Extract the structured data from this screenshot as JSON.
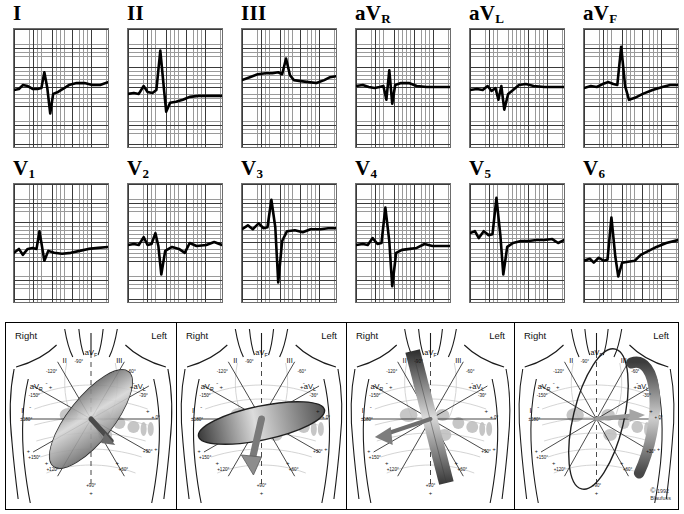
{
  "figure": {
    "copyright_mark": "©",
    "copyright_text": "1992\nBlaufuss"
  },
  "ecg": {
    "rows": [
      {
        "leads": [
          {
            "name": "I",
            "base": "I",
            "sub": ""
          },
          {
            "name": "II",
            "base": "II",
            "sub": ""
          },
          {
            "name": "III",
            "base": "III",
            "sub": ""
          },
          {
            "name": "aVR",
            "base": "aV",
            "sub": "R"
          },
          {
            "name": "aVL",
            "base": "aV",
            "sub": "L"
          },
          {
            "name": "aVF",
            "base": "aV",
            "sub": "F"
          }
        ]
      },
      {
        "leads": [
          {
            "name": "V1",
            "base": "V",
            "sub": "1"
          },
          {
            "name": "V2",
            "base": "V",
            "sub": "2"
          },
          {
            "name": "V3",
            "base": "V",
            "sub": "3"
          },
          {
            "name": "V4",
            "base": "V",
            "sub": "4"
          },
          {
            "name": "V5",
            "base": "V",
            "sub": "5"
          },
          {
            "name": "V6",
            "base": "V",
            "sub": "6"
          }
        ]
      }
    ]
  },
  "torso_panels": [
    {
      "id": "panel-1",
      "right_label": "Right",
      "left_label": "Left"
    },
    {
      "id": "panel-2",
      "right_label": "Right",
      "left_label": "Left"
    },
    {
      "id": "panel-3",
      "right_label": "Right",
      "left_label": "Left"
    },
    {
      "id": "panel-4",
      "right_label": "Right",
      "left_label": "Left"
    }
  ],
  "hexaxial": {
    "lead_labels": {
      "I": "I",
      "II": "II",
      "III": "III",
      "aVR_base": "aV",
      "aVR_sub": "R",
      "aVL_base": "aV",
      "aVL_sub": "L",
      "aVF_base": "aV",
      "aVF_sub": "F"
    },
    "angles": {
      "I_neg": "±180°",
      "I_pos": "+ 0°",
      "II_neg": "-120°",
      "II_pos": "+120°",
      "III_neg": "-60°",
      "III_pos": "+60°",
      "aVR_neg": "-150°",
      "aVR_pos": "+150°",
      "aVL_neg": "-30°",
      "aVL_pos": "+30°",
      "aVF_neg": "-90°",
      "aVF_pos": "+90°"
    },
    "polarity": {
      "plus": "+",
      "minus": "-"
    }
  },
  "chart_data": {
    "type": "line",
    "xlabel": "Time",
    "ylabel": "Amplitude (mV)",
    "grid": true,
    "legend_position": "none",
    "series": [
      {
        "name": "I",
        "points": "M0,62 L5,61 L9,57 L14,58 L19,61 L24,61 L28,60 L31,44 L34,60 L37,86 L40,66 L45,64 L50,61 L56,57 L64,55 L72,55 L80,57 L88,57 L96,54"
      },
      {
        "name": "II",
        "points": "M0,66 L6,65 L11,66 L16,58 L20,64 L25,65 L29,62 L33,22 L37,64 L39,84 L43,75 L49,74 L56,72 L63,69 L72,68 L82,68 L96,68"
      },
      {
        "name": "III",
        "points": "M0,52 L8,49 L16,46 L24,45 L31,45 L37,44 L41,46 L45,30 L49,47 L53,52 L60,53 L68,54 L76,55 L84,52 L90,49 L96,48"
      },
      {
        "name": "aVR",
        "points": "M0,58 L7,57 L13,59 L19,60 L24,59 L28,58 L31,72 L34,42 L37,76 L40,57 L46,55 L54,55 L62,58 L72,59 L84,59 L96,59"
      },
      {
        "name": "aVL",
        "points": "M0,62 L7,61 L13,62 L18,58 L22,63 L26,60 L29,72 L32,58 L35,82 L39,66 L44,62 L50,57 L57,56 L65,58 L76,59 L86,59 L96,59"
      },
      {
        "name": "aVF",
        "points": "M0,60 L7,58 L13,59 L19,56 L25,54 L30,56 L34,57 L38,18 L42,58 L46,72 L52,70 L60,66 L70,62 L80,59 L88,57 L96,57"
      },
      {
        "name": "V1",
        "points": "M0,70 L5,66 L9,72 L14,66 L19,65 L23,66 L26,48 L29,66 L31,78 L35,68 L41,70 L49,71 L58,70 L67,68 L76,66 L86,65 L96,64"
      },
      {
        "name": "V2",
        "points": "M0,62 L6,61 L11,62 L16,54 L20,62 L24,61 L28,50 L31,63 L34,92 L38,68 L45,64 L52,66 L58,70 L63,60 L70,63 L80,62 L88,59 L96,62"
      },
      {
        "name": "V3",
        "points": "M0,46 L6,42 L11,46 L17,40 L22,45 L26,44 L30,16 L34,44 L37,100 L41,58 L46,48 L54,47 L62,49 L70,46 L80,46 L88,45 L96,45"
      },
      {
        "name": "V4",
        "points": "M0,62 L7,61 L12,62 L17,55 L22,61 L26,60 L30,24 L34,58 L37,104 L41,70 L47,67 L55,66 L62,65 L70,61 L78,63 L86,63 L96,63"
      },
      {
        "name": "V5",
        "points": "M0,50 L5,48 L9,55 L14,48 L19,52 L23,51 L27,14 L31,52 L34,92 L38,64 L44,60 L52,58 L60,58 L68,57 L76,57 L84,56 L90,60 L96,57"
      },
      {
        "name": "V6",
        "points": "M0,78 L6,76 L10,80 L15,75 L20,78 L24,77 L28,34 L32,74 L35,94 L39,80 L45,79 L52,78 L58,72 L66,68 L74,64 L84,60 L96,57"
      }
    ]
  }
}
